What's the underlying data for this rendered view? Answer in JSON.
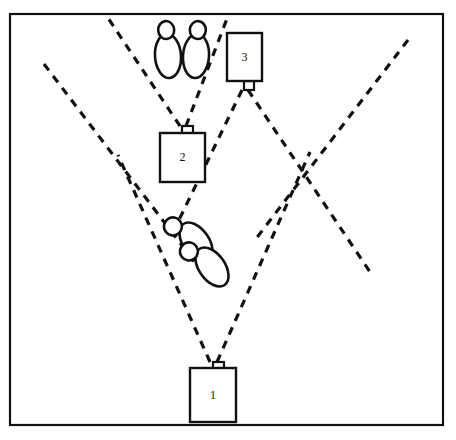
{
  "figure": {
    "type": "forensic-sensor-coverage-diagram",
    "background_color": "#ffffff",
    "line_color": "#111111",
    "frame": {
      "name": "outer-frame",
      "x": 10,
      "y": 14,
      "width": 433,
      "height": 411,
      "stroke_width": 2.2
    },
    "devices": [
      {
        "id": "device-1",
        "label": "1",
        "x": 190,
        "y": 368,
        "width": 46,
        "height": 54,
        "emitter_side": "top",
        "emitter_x": 213,
        "emitter_y": 362,
        "emitter_width": 11,
        "emitter_height": 10
      },
      {
        "id": "device-2",
        "label": "2",
        "x": 160,
        "y": 133,
        "width": 45,
        "height": 49,
        "emitter_side": "top",
        "emitter_x": 182,
        "emitter_y": 126,
        "emitter_width": 11,
        "emitter_height": 9
      },
      {
        "id": "device-3",
        "label": "3",
        "x": 227,
        "y": 33,
        "width": 35,
        "height": 48,
        "emitter_side": "bottom",
        "emitter_x": 244,
        "emitter_y": 81,
        "emitter_width": 10,
        "emitter_height": 9
      }
    ],
    "beams": [
      {
        "name": "beam-device1-left",
        "from_device": "device-1",
        "x1": 210,
        "y1": 362,
        "x2": 118,
        "y2": 155
      },
      {
        "name": "beam-device1-right",
        "from_device": "device-1",
        "x1": 217,
        "y1": 362,
        "x2": 310,
        "y2": 152
      },
      {
        "name": "beam-device2-left",
        "from_device": "device-2",
        "x1": 180,
        "y1": 126,
        "x2": 108,
        "y2": 18
      },
      {
        "name": "beam-device2-right",
        "from_device": "device-2",
        "x1": 186,
        "y1": 126,
        "x2": 228,
        "y2": 16
      },
      {
        "name": "beam-device3-left",
        "from_device": "device-3",
        "x1": 242,
        "y1": 90,
        "x2": 178,
        "y2": 222
      },
      {
        "name": "beam-device3-right",
        "from_device": "device-3",
        "x1": 248,
        "y1": 90,
        "x2": 370,
        "y2": 272
      },
      {
        "name": "beam-long-diagonal-left",
        "x1": 44,
        "y1": 64,
        "x2": 196,
        "y2": 264
      },
      {
        "name": "beam-long-diagonal-right",
        "x1": 408,
        "y1": 40,
        "x2": 255,
        "y2": 240
      }
    ],
    "footprints": [
      {
        "name": "footprint-upper-left",
        "orientation": "pointing-up",
        "rotation_deg": -4,
        "sole_cx": 168,
        "sole_cy": 56,
        "sole_rx": 13,
        "sole_ry": 22,
        "heel_cx": 168,
        "heel_cy": 30,
        "heel_rx": 8,
        "heel_ry": 9
      },
      {
        "name": "footprint-upper-right",
        "orientation": "pointing-up",
        "rotation_deg": 4,
        "sole_cx": 196,
        "sole_cy": 56,
        "sole_rx": 13,
        "sole_ry": 22,
        "heel_cx": 196,
        "heel_cy": 30,
        "heel_rx": 8,
        "heel_ry": 9
      },
      {
        "name": "footprint-lower-upper",
        "orientation": "pointing-upper-right",
        "rotation_deg": 55,
        "sole_cx": 196,
        "sole_cy": 242,
        "sole_rx": 22,
        "sole_ry": 13,
        "heel_cx": 170,
        "heel_cy": 252,
        "heel_rx": 9,
        "heel_ry": 9
      },
      {
        "name": "footprint-lower-lower",
        "orientation": "pointing-upper-right",
        "rotation_deg": 55,
        "sole_cx": 212,
        "sole_cy": 267,
        "sole_rx": 22,
        "sole_ry": 13,
        "heel_cx": 186,
        "heel_cy": 277,
        "heel_rx": 9,
        "heel_ry": 9
      }
    ],
    "dash_pattern": "8 7",
    "dash_width": 3.2
  }
}
